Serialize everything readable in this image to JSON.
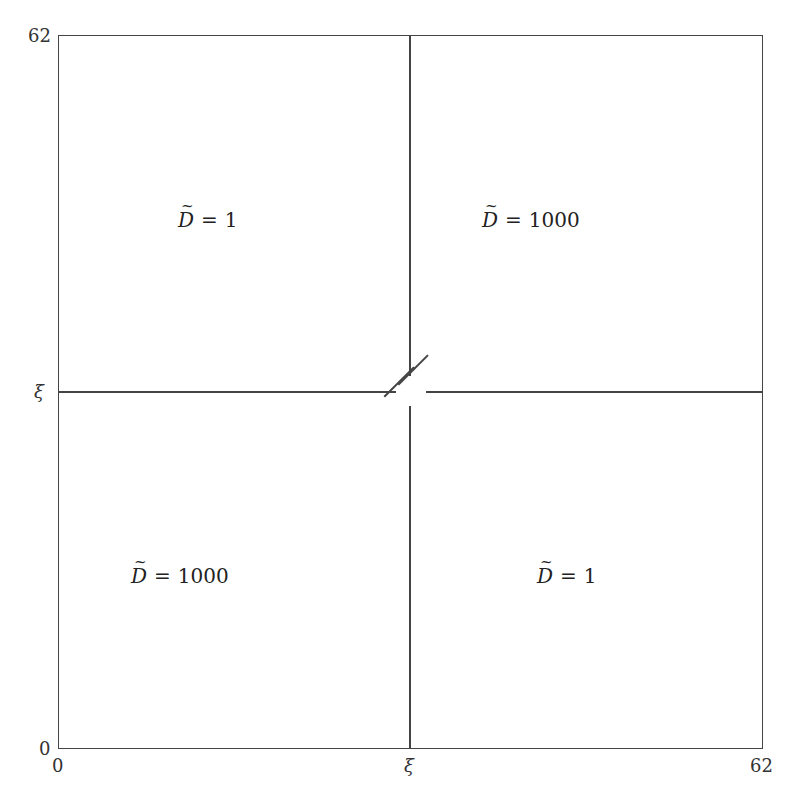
{
  "diagram": {
    "type": "domain-partition",
    "axes": {
      "x_ticks": [
        {
          "label": "0",
          "position": "left"
        },
        {
          "label": "ξ",
          "position": "middle"
        },
        {
          "label": "62",
          "position": "right"
        }
      ],
      "y_ticks": [
        {
          "label": "0",
          "position": "bottom"
        },
        {
          "label": "ξ",
          "position": "middle"
        },
        {
          "label": "62",
          "position": "top"
        }
      ]
    },
    "regions": [
      {
        "quadrant": "top-left",
        "symbol": "D",
        "operator": "=",
        "value": "1"
      },
      {
        "quadrant": "top-right",
        "symbol": "D",
        "operator": "=",
        "value": "1000"
      },
      {
        "quadrant": "bottom-left",
        "symbol": "D",
        "operator": "=",
        "value": "1000"
      },
      {
        "quadrant": "bottom-right",
        "symbol": "D",
        "operator": "=",
        "value": "1"
      }
    ],
    "annotation": "break mark at center intersection (two parallel diagonal strokes)"
  }
}
